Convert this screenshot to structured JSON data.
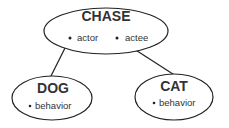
{
  "diagram": {
    "nodes": [
      {
        "id": "chase",
        "title": "CHASE",
        "slots": [
          "actor",
          "actee"
        ]
      },
      {
        "id": "dog",
        "title": "DOG",
        "slots": [
          "behavior"
        ]
      },
      {
        "id": "cat",
        "title": "CAT",
        "slots": [
          "behavior"
        ]
      }
    ],
    "edges": [
      {
        "from": "chase.actor",
        "to": "dog"
      },
      {
        "from": "chase.actee",
        "to": "cat"
      }
    ],
    "colors": {
      "stroke": "#222222",
      "text": "#333333",
      "background": "#ffffff"
    }
  }
}
